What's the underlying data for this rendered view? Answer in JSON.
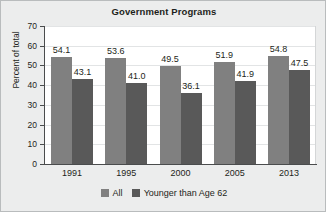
{
  "chart_data": {
    "type": "bar",
    "title": "Government Programs",
    "xlabel": "",
    "ylabel": "Percent of total",
    "categories": [
      "1991",
      "1995",
      "2000",
      "2005",
      "2013"
    ],
    "series": [
      {
        "name": "All",
        "color": "#808080",
        "values": [
          54.1,
          53.6,
          49.5,
          51.9,
          54.8
        ]
      },
      {
        "name": "Younger than Age 62",
        "color": "#595959",
        "values": [
          43.1,
          41.0,
          36.1,
          41.9,
          47.5
        ]
      }
    ],
    "value_labels": {
      "All": [
        "54.1",
        "53.6",
        "49.5",
        "51.9",
        "54.8"
      ],
      "Younger than Age 62": [
        "43.1",
        "41.0",
        "36.1",
        "41.9",
        "47.5"
      ]
    },
    "ylim": [
      0,
      70
    ],
    "ytick_labels": [
      "70",
      "60",
      "50",
      "40",
      "30",
      "20",
      "10",
      "0"
    ],
    "ytick_values": [
      70,
      60,
      50,
      40,
      30,
      20,
      10,
      0
    ],
    "grid": true,
    "legend_position": "bottom"
  },
  "legend": {
    "items": [
      {
        "label": "All",
        "color": "#808080"
      },
      {
        "label": "Younger than Age 62",
        "color": "#595959"
      }
    ]
  },
  "colors": {
    "series_all": "#808080",
    "series_younger": "#595959",
    "figure_background": "#eceded",
    "plot_background": "#ffffff",
    "axis": "#4a4c4d",
    "gridline": "#e2e4e5",
    "text": "#1d1f20"
  }
}
